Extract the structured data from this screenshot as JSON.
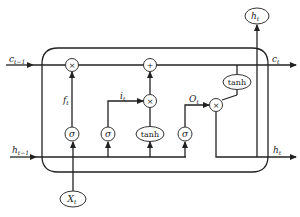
{
  "diagram": {
    "inputs": {
      "c_prev": {
        "base": "c",
        "sub": "t−1"
      },
      "h_prev": {
        "base": "h",
        "sub": "t−1"
      },
      "x": {
        "base": "X",
        "sub": "t"
      }
    },
    "outputs": {
      "c_out": {
        "base": "c",
        "sub": "t"
      },
      "h_out_right": {
        "base": "h",
        "sub": "t"
      },
      "h_out_top": {
        "base": "h",
        "sub": "t"
      }
    },
    "gates": {
      "forget": {
        "base": "f",
        "sub": "t"
      },
      "input": {
        "base": "i",
        "sub": "t"
      },
      "output": {
        "base": "O",
        "sub": "t"
      }
    },
    "ops": {
      "multiply": "×",
      "add": "+",
      "sigmoid": "σ",
      "tanh": "tanh"
    }
  }
}
